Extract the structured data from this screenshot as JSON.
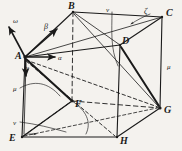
{
  "figure": {
    "type": "hand-drawn-geometry-diagram",
    "background_color": "#f4f2ee",
    "ink_color": "#1a1a1a"
  },
  "vertices": [
    {
      "label": "A",
      "x": 25,
      "y": 57,
      "role": "top-face-front-left"
    },
    {
      "label": "B",
      "x": 73,
      "y": 12,
      "role": "top-face-back-left"
    },
    {
      "label": "C",
      "x": 162,
      "y": 17,
      "role": "top-face-back-right"
    },
    {
      "label": "D",
      "x": 120,
      "y": 45,
      "role": "top-face-front-right"
    },
    {
      "label": "E",
      "x": 22,
      "y": 137,
      "role": "bottom-face-front-left"
    },
    {
      "label": "F",
      "x": 72,
      "y": 101,
      "role": "bottom-face-back-left"
    },
    {
      "label": "G",
      "x": 160,
      "y": 108,
      "role": "bottom-face-back-right"
    },
    {
      "label": "H",
      "x": 117,
      "y": 137,
      "role": "bottom-face-front-right"
    }
  ],
  "vertex_labels": [
    {
      "name": "vertex-label-A",
      "text": "A",
      "x": 15,
      "y": 51
    },
    {
      "name": "vertex-label-B",
      "text": "B",
      "x": 68,
      "y": 1
    },
    {
      "name": "vertex-label-C",
      "text": "C",
      "x": 166,
      "y": 8
    },
    {
      "name": "vertex-label-D",
      "text": "D",
      "x": 122,
      "y": 36
    },
    {
      "name": "vertex-label-E",
      "text": "E",
      "x": 9,
      "y": 133
    },
    {
      "name": "vertex-label-F",
      "text": "F",
      "x": 75,
      "y": 99
    },
    {
      "name": "vertex-label-G",
      "text": "G",
      "x": 164,
      "y": 105
    },
    {
      "name": "vertex-label-H",
      "text": "H",
      "x": 120,
      "y": 136
    }
  ],
  "greek_labels": [
    {
      "name": "vector-label-omega",
      "text": "ω",
      "x": 13,
      "y": 18,
      "size": "g-sm"
    },
    {
      "name": "vector-label-beta",
      "text": "β",
      "x": 44,
      "y": 23,
      "size": "g"
    },
    {
      "name": "vector-label-alpha",
      "text": "α",
      "x": 58,
      "y": 55,
      "size": "g-sm"
    },
    {
      "name": "vector-label-gamma",
      "text": "γ",
      "x": 26,
      "y": 65,
      "size": "g-sm"
    },
    {
      "name": "label-nu-top",
      "text": "ν",
      "x": 106,
      "y": 7,
      "size": "g-sm"
    },
    {
      "name": "label-zeta",
      "text": "ζ",
      "x": 144,
      "y": 8,
      "size": "g"
    },
    {
      "name": "label-mu-right",
      "text": "μ",
      "x": 167,
      "y": 64,
      "size": "g-sm"
    },
    {
      "name": "label-mu-left",
      "text": "μ",
      "x": 13,
      "y": 86,
      "size": "g-sm"
    },
    {
      "name": "label-nu-lower",
      "text": "ν",
      "x": 13,
      "y": 120,
      "size": "g-sm"
    }
  ],
  "edges": {
    "solid_top_face": [
      "A-B",
      "B-C",
      "C-D",
      "D-A"
    ],
    "solid_bottom_face": [
      "E-H",
      "H-G",
      "G-F"
    ],
    "solid_verticals": [
      "A-E",
      "C-G",
      "D-H"
    ],
    "hidden_dashed": [
      "B-F",
      "E-F",
      "F-G"
    ]
  },
  "vectors_from_A": [
    {
      "name": "omega",
      "label": "ω",
      "direction": "up-left"
    },
    {
      "name": "beta",
      "label": "β",
      "direction": "up-right toward B"
    },
    {
      "name": "alpha",
      "label": "α",
      "direction": "right"
    },
    {
      "name": "gamma",
      "label": "γ",
      "direction": "down"
    }
  ],
  "ray_targets_from_A": [
    "F",
    "G",
    "H",
    "E"
  ]
}
